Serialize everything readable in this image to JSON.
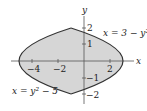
{
  "diagram": {
    "type": "region between curves",
    "axes": {
      "x_label": "x",
      "y_label": "y",
      "x_ticks": [
        {
          "value": -4,
          "label": "−4"
        },
        {
          "value": -2,
          "label": "−2"
        },
        {
          "value": 2,
          "label": "2"
        }
      ],
      "y_ticks": [
        {
          "value": 2,
          "label": "2"
        },
        {
          "value": 1,
          "label": "1"
        },
        {
          "value": -1,
          "label": "−1"
        },
        {
          "value": -2,
          "label": "−2"
        }
      ]
    },
    "curves": [
      {
        "name": "right-parabola",
        "label": "x = 3 − y²",
        "equation": "x = 3 - y^2"
      },
      {
        "name": "left-parabola",
        "label": "x = y² − 5",
        "equation": "x = y^2 - 5"
      }
    ],
    "intersections": [
      [
        -1,
        2
      ],
      [
        -1,
        -2
      ]
    ],
    "colors": {
      "fill": "#d6d6d6",
      "curve": "#333333",
      "axis": "#555555",
      "text": "#222222"
    }
  }
}
